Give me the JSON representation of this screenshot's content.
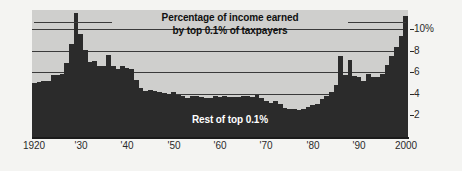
{
  "chart_data": {
    "type": "bar",
    "title": "Percentage of income earned by top 0.1% of taxpayers",
    "title_line1": "Percentage of income earned",
    "title_line2": "by top 0.1% of taxpayers",
    "inner_label": "Rest of top 0.1%",
    "xlabel": "",
    "ylabel": "",
    "ylim": [
      0,
      11.8
    ],
    "xlim": [
      1920,
      2000
    ],
    "grid": true,
    "gridlines": [
      2,
      4,
      6,
      8,
      10
    ],
    "legend": "none",
    "bar_color": "#2b2b2b",
    "plot_background": "#cfcfcd",
    "page_background": "#f4f4f2",
    "ytick_labels": [
      "10%",
      "8",
      "6",
      "4",
      "2"
    ],
    "ytick_values": [
      10,
      8,
      6,
      4,
      2
    ],
    "xtick_labels": [
      "1920",
      "'30",
      "'40",
      "'50",
      "'60",
      "'70",
      "'80",
      "'90",
      "2000"
    ],
    "xtick_values": [
      1920,
      1930,
      1940,
      1950,
      1960,
      1970,
      1980,
      1990,
      2000
    ],
    "categories": [
      1920,
      1921,
      1922,
      1923,
      1924,
      1925,
      1926,
      1927,
      1928,
      1929,
      1930,
      1931,
      1932,
      1933,
      1934,
      1935,
      1936,
      1937,
      1938,
      1939,
      1940,
      1941,
      1942,
      1943,
      1944,
      1945,
      1946,
      1947,
      1948,
      1949,
      1950,
      1951,
      1952,
      1953,
      1954,
      1955,
      1956,
      1957,
      1958,
      1959,
      1960,
      1961,
      1962,
      1963,
      1964,
      1965,
      1966,
      1967,
      1968,
      1969,
      1970,
      1971,
      1972,
      1973,
      1974,
      1975,
      1976,
      1977,
      1978,
      1979,
      1980,
      1981,
      1982,
      1983,
      1984,
      1985,
      1986,
      1987,
      1988,
      1989,
      1990,
      1991,
      1992,
      1993,
      1994,
      1995,
      1996,
      1997,
      1998,
      1999,
      2000
    ],
    "values": [
      5.0,
      5.1,
      5.2,
      5.2,
      5.8,
      5.8,
      5.9,
      6.9,
      8.6,
      11.5,
      9.6,
      8.1,
      7.0,
      7.1,
      6.6,
      6.6,
      7.6,
      6.6,
      6.3,
      6.6,
      6.4,
      6.3,
      5.3,
      4.6,
      4.3,
      4.4,
      4.3,
      4.2,
      4.1,
      4.0,
      4.2,
      3.9,
      3.8,
      3.6,
      3.8,
      3.8,
      3.7,
      3.6,
      3.6,
      3.8,
      3.7,
      3.8,
      3.7,
      3.7,
      3.7,
      3.8,
      3.8,
      3.7,
      3.9,
      3.6,
      3.3,
      3.2,
      3.3,
      3.1,
      2.7,
      2.6,
      2.6,
      2.5,
      2.6,
      2.8,
      3.0,
      3.1,
      3.5,
      3.8,
      4.2,
      4.8,
      7.5,
      5.8,
      7.2,
      5.7,
      5.6,
      5.2,
      5.9,
      5.6,
      5.6,
      5.9,
      6.7,
      7.5,
      8.4,
      9.4,
      11.2
    ]
  }
}
